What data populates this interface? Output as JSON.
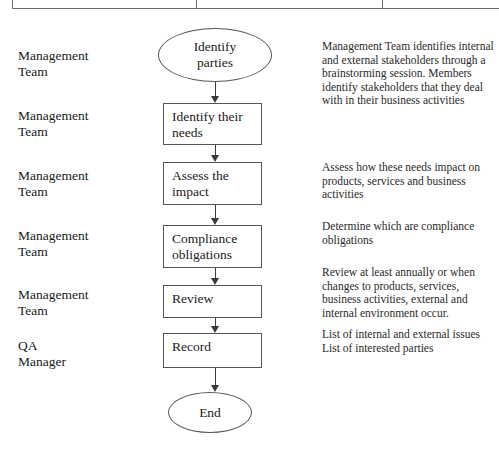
{
  "document": {
    "type": "flowchart",
    "title": "Interested Parties / Compliance Obligations Process"
  },
  "actors": [
    {
      "name": "actor-1",
      "label": "Management\nTeam",
      "top": 48
    },
    {
      "name": "actor-2",
      "label": "Management\nTeam",
      "top": 108
    },
    {
      "name": "actor-3",
      "label": "Management\nTeam",
      "top": 168
    },
    {
      "name": "actor-4",
      "label": "Management\nTeam",
      "top": 228
    },
    {
      "name": "actor-5",
      "label": "Management\nTeam",
      "top": 287
    },
    {
      "name": "actor-6",
      "label": "QA\nManager",
      "top": 338
    }
  ],
  "nodes": [
    {
      "name": "start-identify-parties",
      "shape": "oval",
      "label": "Identify\nparties",
      "left": 158,
      "top": 28,
      "width": 114,
      "height": 54
    },
    {
      "name": "identify-their-needs",
      "shape": "box",
      "label": "Identify their\nneeds",
      "left": 163,
      "top": 103,
      "width": 99,
      "height": 42
    },
    {
      "name": "assess-the-impact",
      "shape": "box",
      "label": "Assess the\nimpact",
      "left": 163,
      "top": 162,
      "width": 99,
      "height": 43
    },
    {
      "name": "compliance-obligations",
      "shape": "box",
      "label": "Compliance\nobligations",
      "left": 163,
      "top": 225,
      "width": 99,
      "height": 43
    },
    {
      "name": "review",
      "shape": "box",
      "label": "Review",
      "left": 163,
      "top": 285,
      "width": 99,
      "height": 33
    },
    {
      "name": "record",
      "shape": "box",
      "label": "Record",
      "left": 163,
      "top": 333,
      "width": 99,
      "height": 35
    },
    {
      "name": "end",
      "shape": "oval",
      "label": "End",
      "left": 168,
      "top": 392,
      "width": 84,
      "height": 41
    }
  ],
  "connectors": [
    {
      "name": "arrow-start-to-needs",
      "top": 82,
      "length": 21
    },
    {
      "name": "arrow-needs-to-assess",
      "top": 145,
      "length": 17
    },
    {
      "name": "arrow-assess-to-compliance",
      "top": 205,
      "length": 20
    },
    {
      "name": "arrow-compliance-to-review",
      "top": 268,
      "length": 17
    },
    {
      "name": "arrow-review-to-record",
      "top": 318,
      "length": 15
    },
    {
      "name": "arrow-record-to-end",
      "top": 368,
      "length": 24
    }
  ],
  "descriptions": [
    {
      "name": "desc-identify-parties",
      "top": 40,
      "text": "Management Team identifies internal and external stakeholders through a brainstorming session. Members identify stakeholders that they deal with in their business activities"
    },
    {
      "name": "desc-assess-the-impact",
      "top": 161,
      "text": "Assess how these needs impact on products, services and business activities"
    },
    {
      "name": "desc-compliance-obligations",
      "top": 220,
      "text": "Determine which are compliance obligations"
    },
    {
      "name": "desc-review",
      "top": 266,
      "text": "Review at least annually or when changes to products, services, business activities, external and internal environment occur."
    },
    {
      "name": "desc-record",
      "top": 328,
      "text": "List of internal and external issues\nList of interested parties"
    }
  ],
  "colors": {
    "background": "#ffffff",
    "node_border": "#555555",
    "connector": "#3a3a3a",
    "text": "#1a1a1a",
    "table_rule": "#6d6d6d"
  }
}
